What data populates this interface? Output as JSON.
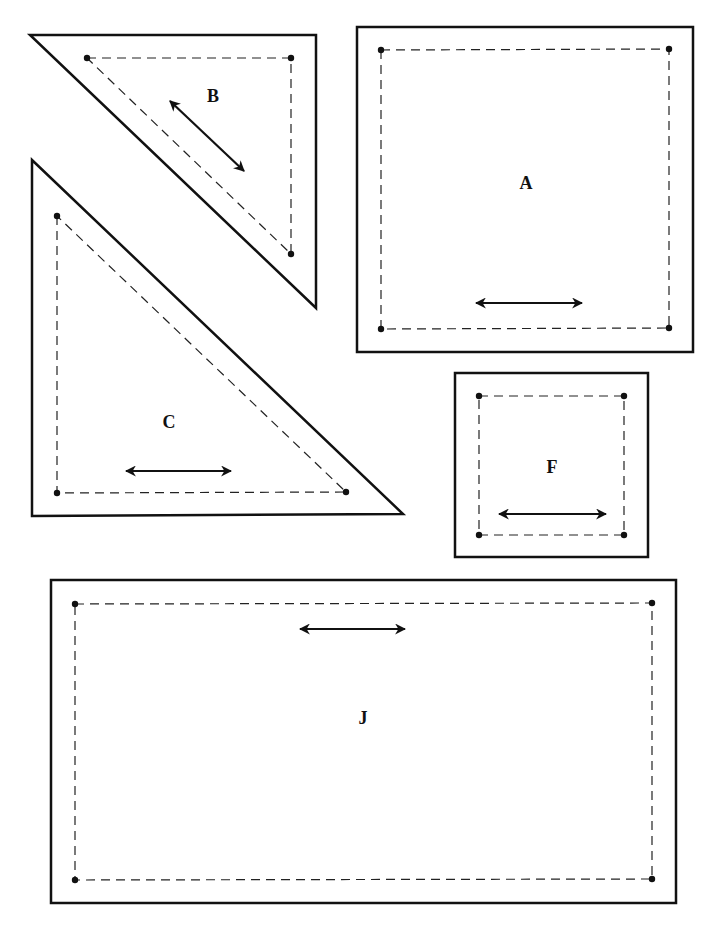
{
  "colors": {
    "line": "#111111",
    "background": "#ffffff"
  },
  "pieces": [
    {
      "id": "B",
      "label": "B",
      "shape": "triangle",
      "outline": [
        [
          30,
          35
        ],
        [
          316,
          35
        ],
        [
          316,
          308
        ]
      ],
      "seam": [
        [
          87,
          58
        ],
        [
          291,
          58
        ],
        [
          291,
          254
        ]
      ],
      "grain_arrow": [
        [
          170,
          101
        ],
        [
          244,
          171
        ]
      ],
      "label_pos": [
        213,
        98
      ]
    },
    {
      "id": "C",
      "label": "C",
      "shape": "triangle",
      "outline": [
        [
          32,
          160
        ],
        [
          32,
          516
        ],
        [
          403,
          514
        ]
      ],
      "seam": [
        [
          57,
          216
        ],
        [
          57,
          493
        ],
        [
          346,
          492
        ]
      ],
      "grain_arrow": [
        [
          126,
          471
        ],
        [
          231,
          471
        ]
      ],
      "label_pos": [
        169,
        424
      ]
    },
    {
      "id": "A",
      "label": "A",
      "shape": "square",
      "outline": [
        [
          357,
          27
        ],
        [
          693,
          27
        ],
        [
          693,
          352
        ],
        [
          357,
          352
        ]
      ],
      "seam": [
        [
          381,
          50
        ],
        [
          669,
          49
        ],
        [
          669,
          328
        ],
        [
          381,
          329
        ]
      ],
      "grain_arrow": [
        [
          476,
          303
        ],
        [
          582,
          303
        ]
      ],
      "label_pos": [
        526,
        185
      ]
    },
    {
      "id": "F",
      "label": "F",
      "shape": "square",
      "outline": [
        [
          455,
          373
        ],
        [
          648,
          373
        ],
        [
          648,
          557
        ],
        [
          455,
          557
        ]
      ],
      "seam": [
        [
          479,
          396
        ],
        [
          624,
          396
        ],
        [
          624,
          535
        ],
        [
          479,
          535
        ]
      ],
      "grain_arrow": [
        [
          499,
          514
        ],
        [
          606,
          514
        ]
      ],
      "label_pos": [
        552,
        469
      ]
    },
    {
      "id": "J",
      "label": "J",
      "shape": "rectangle",
      "outline": [
        [
          51,
          580
        ],
        [
          676,
          580
        ],
        [
          676,
          903
        ],
        [
          51,
          903
        ]
      ],
      "seam": [
        [
          75,
          604
        ],
        [
          652,
          603
        ],
        [
          652,
          879
        ],
        [
          75,
          880
        ]
      ],
      "grain_arrow": [
        [
          300,
          629
        ],
        [
          405,
          629
        ]
      ],
      "label_pos": [
        363,
        720
      ]
    }
  ]
}
